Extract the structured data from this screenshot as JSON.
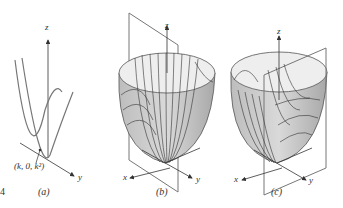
{
  "figure": {
    "panels": [
      {
        "id": "a",
        "caption": "(a)",
        "axis_labels": {
          "z": "z",
          "y": "y"
        },
        "point_label": "(k, 0, k²)"
      },
      {
        "id": "b",
        "caption": "(b)",
        "axis_labels": {
          "z": "z",
          "x": "x",
          "y": "y"
        }
      },
      {
        "id": "c",
        "caption": "(c)",
        "axis_labels": {
          "z": "z",
          "x": "x",
          "y": "y"
        }
      }
    ],
    "side_mark": "4",
    "colors": {
      "line": "#555555",
      "surface_fill": "#c8c8c8",
      "surface_inner": "#eeeeee",
      "plane": "#777777"
    }
  }
}
